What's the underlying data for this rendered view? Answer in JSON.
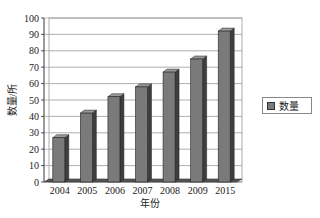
{
  "chart_data": {
    "type": "bar",
    "title": "",
    "xlabel": "年份",
    "ylabel": "数量/所",
    "categories": [
      "2004",
      "2005",
      "2006",
      "2007",
      "2008",
      "2009",
      "2015"
    ],
    "series": [
      {
        "name": "数量",
        "values": [
          27,
          42,
          52,
          58,
          67,
          75,
          92
        ]
      }
    ],
    "ylim": [
      0,
      100
    ],
    "yticks": [
      0,
      10,
      20,
      30,
      40,
      50,
      60,
      70,
      80,
      90,
      100
    ],
    "grid": true,
    "legend_position": "right",
    "style": "3d-column",
    "bar_color": "#7a7a7a"
  },
  "legend": {
    "label": "数量"
  }
}
